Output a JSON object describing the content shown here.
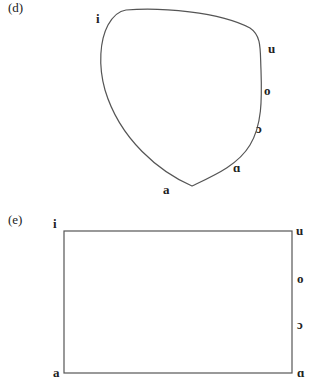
{
  "panels": [
    {
      "label": "(d)",
      "shape": "curved-quadrilateral",
      "vowels": {
        "i": "i",
        "u": "u",
        "o": "o",
        "open_o": "ɔ",
        "alpha": "ɑ",
        "a": "a"
      }
    },
    {
      "label": "(e)",
      "shape": "rectangle",
      "vowels": {
        "i": "i",
        "u": "u",
        "o": "o",
        "open_o": "ɔ",
        "alpha": "ɑ",
        "a": "a"
      }
    }
  ],
  "colors": {
    "line": "#555555",
    "text": "#222222"
  }
}
